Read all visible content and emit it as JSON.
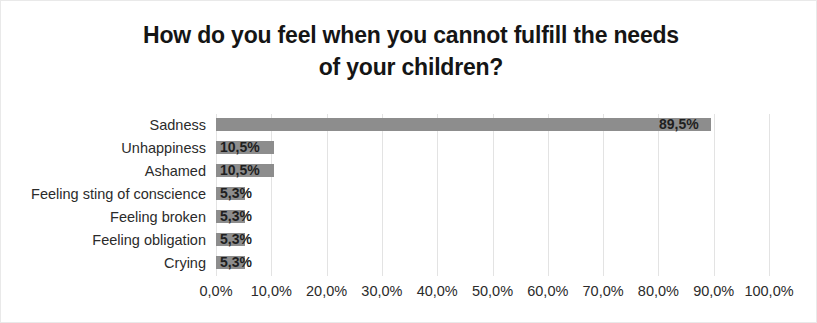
{
  "chart_data": {
    "type": "bar",
    "orientation": "horizontal",
    "title": "How do you feel when you cannot fulfill the needs of your children?",
    "title_lines": [
      "How do you feel when you cannot fulfill the needs",
      "of your children?"
    ],
    "xlabel": "",
    "ylabel": "",
    "categories": [
      "Sadness",
      "Unhappiness",
      "Ashamed",
      "Feeling sting of conscience",
      "Feeling broken",
      "Feeling obligation",
      "Crying"
    ],
    "values": [
      89.5,
      10.5,
      10.5,
      5.3,
      5.3,
      5.3,
      5.3
    ],
    "value_labels": [
      "89,5%",
      "10,5%",
      "10,5%",
      "5,3%",
      "5,3%",
      "5,3%",
      "5,3%"
    ],
    "xlim": [
      0,
      100
    ],
    "xticks": [
      0,
      10,
      20,
      30,
      40,
      50,
      60,
      70,
      80,
      90,
      100
    ],
    "xtick_labels": [
      "0,0%",
      "10,0%",
      "20,0%",
      "30,0%",
      "40,0%",
      "50,0%",
      "60,0%",
      "70,0%",
      "80,0%",
      "90,0%",
      "100,0%"
    ],
    "grid": true,
    "grid_axis": "x",
    "legend": false,
    "bar_color": "#8d8d8d",
    "grid_color": "#e3e3e3",
    "text_color": "#2b2b2b",
    "title_color": "#151515",
    "background": "#ffffff",
    "border_color": "#e9e9e9"
  }
}
